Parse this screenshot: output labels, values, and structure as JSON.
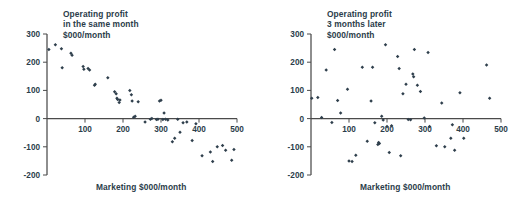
{
  "figure": {
    "background": "#ffffff",
    "marker_color": "#2f3f4c",
    "axis_color": "#4a4a4a",
    "text_color": "#2b3d4a"
  },
  "panels": [
    {
      "id": "left",
      "title_line1": "Operating profit",
      "title_line2": "in the same month",
      "title_line3": "$000/month",
      "xlabel": "Marketing $000/month"
    },
    {
      "id": "right",
      "title_line1": "Operating profit",
      "title_line2": "3 months later",
      "title_line3": "$000/month",
      "xlabel": "Marketing $000/month"
    }
  ],
  "chart_data": [
    {
      "type": "scatter",
      "title": "Operating profit in the same month $000/month",
      "xlabel": "Marketing $000/month",
      "ylabel": "Operating profit in the same month $000/month",
      "xlim": [
        0,
        500
      ],
      "ylim": [
        -200,
        300
      ],
      "xticks": [
        100,
        200,
        300,
        400,
        500
      ],
      "yticks": [
        -200,
        -100,
        0,
        100,
        200,
        300
      ],
      "grid": false,
      "legend": "none",
      "series": [
        {
          "name": "same month",
          "points": [
            [
              5,
              245
            ],
            [
              22,
              262
            ],
            [
              38,
              248
            ],
            [
              40,
              180
            ],
            [
              63,
              232
            ],
            [
              66,
              225
            ],
            [
              95,
              185
            ],
            [
              97,
              175
            ],
            [
              108,
              178
            ],
            [
              112,
              172
            ],
            [
              125,
              118
            ],
            [
              127,
              122
            ],
            [
              160,
              145
            ],
            [
              178,
              95
            ],
            [
              182,
              88
            ],
            [
              184,
              72
            ],
            [
              186,
              68
            ],
            [
              190,
              57
            ],
            [
              192,
              66
            ],
            [
              218,
              100
            ],
            [
              222,
              85
            ],
            [
              224,
              62
            ],
            [
              228,
              5
            ],
            [
              232,
              8
            ],
            [
              240,
              60
            ],
            [
              258,
              -12
            ],
            [
              272,
              -2
            ],
            [
              276,
              0
            ],
            [
              288,
              -3
            ],
            [
              292,
              -2
            ],
            [
              296,
              62
            ],
            [
              300,
              65
            ],
            [
              305,
              -3
            ],
            [
              308,
              20
            ],
            [
              312,
              -2
            ],
            [
              318,
              -5
            ],
            [
              330,
              -82
            ],
            [
              336,
              -70
            ],
            [
              344,
              -2
            ],
            [
              350,
              -48
            ],
            [
              358,
              -15
            ],
            [
              368,
              -12
            ],
            [
              382,
              -78
            ],
            [
              392,
              -18
            ],
            [
              408,
              -132
            ],
            [
              430,
              -118
            ],
            [
              436,
              -152
            ],
            [
              448,
              -100
            ],
            [
              462,
              -95
            ],
            [
              470,
              -112
            ],
            [
              486,
              -148
            ],
            [
              492,
              -110
            ]
          ]
        }
      ]
    },
    {
      "type": "scatter",
      "title": "Operating profit 3 months later $000/month",
      "xlabel": "Marketing $000/month",
      "ylabel": "Operating profit 3 months later $000/month",
      "xlim": [
        0,
        500
      ],
      "ylim": [
        -200,
        300
      ],
      "xticks": [
        100,
        200,
        300,
        400,
        500
      ],
      "yticks": [
        -200,
        -100,
        0,
        100,
        200,
        300
      ],
      "grid": false,
      "legend": "none",
      "series": [
        {
          "name": "3 months later",
          "points": [
            [
              2,
              72
            ],
            [
              18,
              75
            ],
            [
              28,
              4
            ],
            [
              40,
              172
            ],
            [
              55,
              -14
            ],
            [
              62,
              245
            ],
            [
              70,
              64
            ],
            [
              78,
              20
            ],
            [
              96,
              104
            ],
            [
              100,
              -150
            ],
            [
              108,
              -152
            ],
            [
              118,
              -130
            ],
            [
              135,
              182
            ],
            [
              148,
              -80
            ],
            [
              158,
              62
            ],
            [
              162,
              182
            ],
            [
              168,
              -15
            ],
            [
              176,
              -92
            ],
            [
              178,
              -85
            ],
            [
              180,
              -88
            ],
            [
              186,
              8
            ],
            [
              190,
              -5
            ],
            [
              196,
              262
            ],
            [
              200,
              -28
            ],
            [
              206,
              -120
            ],
            [
              212,
              -25
            ],
            [
              228,
              220
            ],
            [
              232,
              178
            ],
            [
              236,
              -132
            ],
            [
              242,
              88
            ],
            [
              250,
              122
            ],
            [
              256,
              -3
            ],
            [
              262,
              -4
            ],
            [
              268,
              158
            ],
            [
              270,
              148
            ],
            [
              272,
              245
            ],
            [
              280,
              118
            ],
            [
              288,
              96
            ],
            [
              298,
              2
            ],
            [
              308,
              234
            ],
            [
              312,
              -28
            ],
            [
              330,
              -96
            ],
            [
              344,
              55
            ],
            [
              352,
              -100
            ],
            [
              368,
              -70
            ],
            [
              372,
              -22
            ],
            [
              378,
              -112
            ],
            [
              392,
              92
            ],
            [
              402,
              -70
            ],
            [
              462,
              190
            ],
            [
              470,
              72
            ]
          ]
        }
      ]
    }
  ]
}
